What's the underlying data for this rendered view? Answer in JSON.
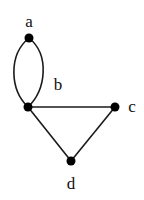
{
  "graph": {
    "nodes": [
      {
        "id": "a",
        "label": "a",
        "x": 29,
        "y": 38,
        "label_x": 29,
        "label_y": 27
      },
      {
        "id": "b",
        "label": "b",
        "x": 28,
        "y": 107,
        "label_x": 58,
        "label_y": 90
      },
      {
        "id": "c",
        "label": "c",
        "x": 115,
        "y": 107,
        "label_x": 132,
        "label_y": 112
      },
      {
        "id": "d",
        "label": "d",
        "x": 71,
        "y": 161,
        "label_x": 71,
        "label_y": 189
      }
    ],
    "edges": [
      {
        "from": "a",
        "to": "b",
        "type": "curved-left"
      },
      {
        "from": "a",
        "to": "b",
        "type": "curved-right"
      },
      {
        "from": "b",
        "to": "c",
        "type": "straight"
      },
      {
        "from": "b",
        "to": "d",
        "type": "straight"
      },
      {
        "from": "c",
        "to": "d",
        "type": "straight"
      }
    ],
    "colors": {
      "node": "#000000",
      "edge": "#1a1a1a",
      "background": "#ffffff"
    }
  }
}
